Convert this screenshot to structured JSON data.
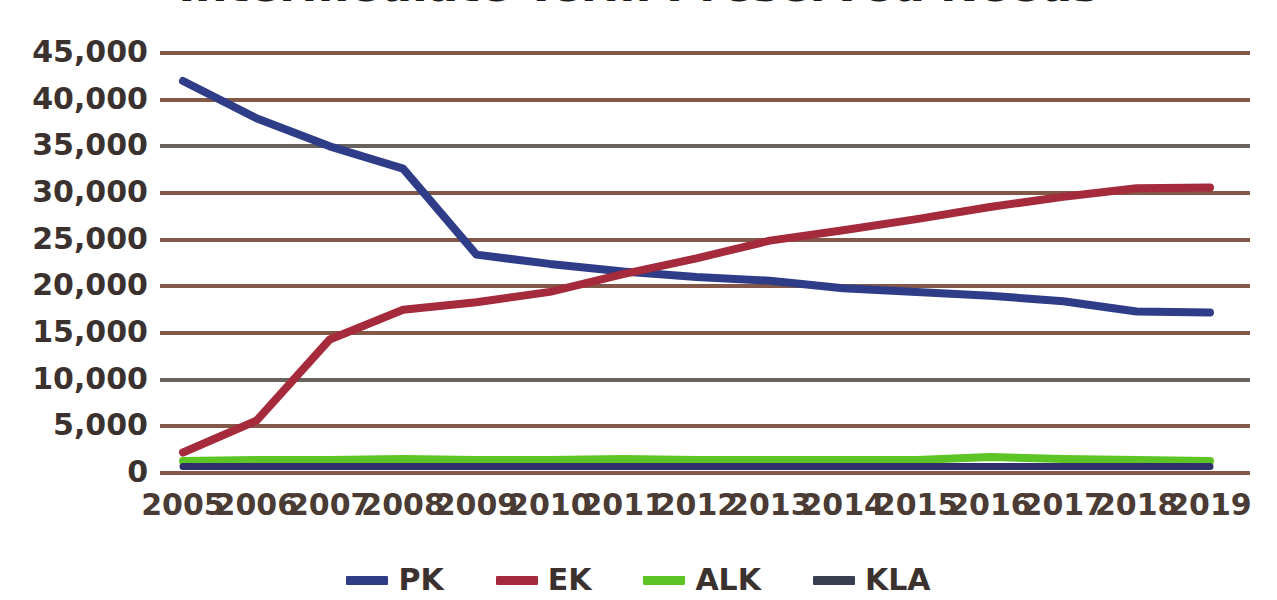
{
  "chart_data": {
    "type": "line",
    "title": "Intermediate Term Preserved Needs",
    "xlabel": "",
    "ylabel": "",
    "grid": true,
    "legend_position": "bottom-center",
    "categories": [
      "2005",
      "2006",
      "2007",
      "2008",
      "2009",
      "2010",
      "2011",
      "2012",
      "2013",
      "2014",
      "2015",
      "2016",
      "2017",
      "2018",
      "2019"
    ],
    "ylim": [
      0,
      45000
    ],
    "ytick_step": 5000,
    "ytick_labels": [
      "45,000",
      "40,000",
      "35,000",
      "30,000",
      "25,000",
      "20,000",
      "15,000",
      "10,000",
      "5,000",
      "0"
    ],
    "ytick_values": [
      45000,
      40000,
      35000,
      30000,
      25000,
      20000,
      15000,
      10000,
      5000,
      0
    ],
    "series": [
      {
        "name": "PK",
        "color": "#2f3c88",
        "values": [
          42000,
          38000,
          35000,
          32600,
          23400,
          22400,
          21600,
          21000,
          20600,
          19800,
          19400,
          19000,
          18400,
          17300,
          17200
        ]
      },
      {
        "name": "EK",
        "color": "#a52a3c",
        "values": [
          2200,
          5600,
          14300,
          17500,
          18300,
          19400,
          21300,
          23000,
          24900,
          26000,
          27200,
          28500,
          29600,
          30500,
          30600
        ]
      },
      {
        "name": "ALK",
        "color": "#5cc425",
        "values": [
          1300,
          1400,
          1400,
          1500,
          1400,
          1400,
          1500,
          1400,
          1400,
          1400,
          1400,
          1700,
          1500,
          1400,
          1300
        ]
      },
      {
        "name": "KLA",
        "color": "#30306b",
        "values": [
          700,
          700,
          700,
          700,
          700,
          700,
          700,
          700,
          700,
          700,
          700,
          700,
          700,
          700,
          700
        ]
      }
    ]
  },
  "legend": {
    "items": [
      {
        "label": "PK",
        "color": "#2f3c88"
      },
      {
        "label": "EK",
        "color": "#a52a3c"
      },
      {
        "label": "ALK",
        "color": "#5cc425"
      },
      {
        "label": "KLA",
        "color": "#3a3f52"
      }
    ]
  }
}
